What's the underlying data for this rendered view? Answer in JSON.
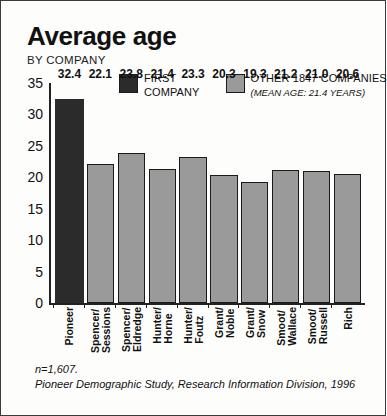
{
  "chart_data": {
    "type": "bar",
    "title": "Average age",
    "subtitle": "BY COMPANY",
    "categories": [
      "Pioneer",
      "Spencer/ Sessions",
      "Spencer/ Eldredge",
      "Hunter/ Horne",
      "Hunter/ Foutz",
      "Grant/ Noble",
      "Grant/ Snow",
      "Smoot/ Wallace",
      "Smoot/ Russell",
      "Rich"
    ],
    "category_lines": [
      [
        "Pioneer",
        ""
      ],
      [
        "Spencer/",
        "Sessions"
      ],
      [
        "Spencer/",
        "Eldredge"
      ],
      [
        "Hunter/",
        "Horne"
      ],
      [
        "Hunter/",
        "Foutz"
      ],
      [
        "Grant/",
        "Noble"
      ],
      [
        "Grant/",
        "Snow"
      ],
      [
        "Smoot/",
        "Wallace"
      ],
      [
        "Smoot/",
        "Russell"
      ],
      [
        "Rich",
        ""
      ]
    ],
    "values": [
      32.4,
      22.1,
      23.8,
      21.4,
      23.3,
      20.3,
      19.3,
      21.2,
      21.0,
      20.6
    ],
    "value_labels": [
      "32.4",
      "22.1",
      "23.8",
      "21.4",
      "23.3",
      "20.3",
      "19.3",
      "21.2",
      "21.0",
      "20.6"
    ],
    "highlight_index": 0,
    "xlabel": "",
    "ylabel": "",
    "ylim": [
      0,
      35
    ],
    "yticks": [
      35,
      30,
      25,
      20,
      15,
      10,
      5,
      0
    ],
    "ytick_labels": [
      "35",
      "30",
      "25",
      "20",
      "15",
      "10",
      "5",
      "0"
    ],
    "grid": false,
    "legend_position": "top",
    "colors": {
      "highlight_bar": "#2b2b2b",
      "other_bar": "#9a9a9a",
      "bar_outline": "#1a1a1a",
      "axis": "#222222",
      "text": "#111111",
      "background": "#fdfdfc"
    }
  },
  "legend": {
    "entries": [
      {
        "name": "first-company",
        "line1": "FIRST",
        "line2": "COMPANY",
        "sub": "",
        "swatch": "#2b2b2b"
      },
      {
        "name": "other-companies",
        "line1": "OTHER 1847 COMPANIES",
        "line2": "",
        "sub": "(MEAN AGE: 21.4 YEARS)",
        "swatch": "#9a9a9a"
      }
    ]
  },
  "footnote": {
    "n": "n=1,607.",
    "source": "Pioneer Demographic Study, Research Information Division, 1996"
  }
}
